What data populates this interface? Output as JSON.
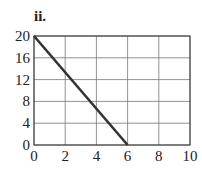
{
  "panel_label": "ii.",
  "chart_data": {
    "type": "line",
    "title": "",
    "xlabel": "",
    "ylabel": "",
    "xlim": [
      0,
      10
    ],
    "ylim": [
      0,
      20
    ],
    "grid": true,
    "x_ticks": [
      "0",
      "2",
      "4",
      "6",
      "8",
      "10"
    ],
    "y_ticks": [
      "0",
      "4",
      "8",
      "12",
      "16",
      "20"
    ],
    "series": [
      {
        "name": "line",
        "x": [
          0,
          6
        ],
        "y": [
          20,
          0
        ],
        "color": "#333333"
      }
    ]
  }
}
